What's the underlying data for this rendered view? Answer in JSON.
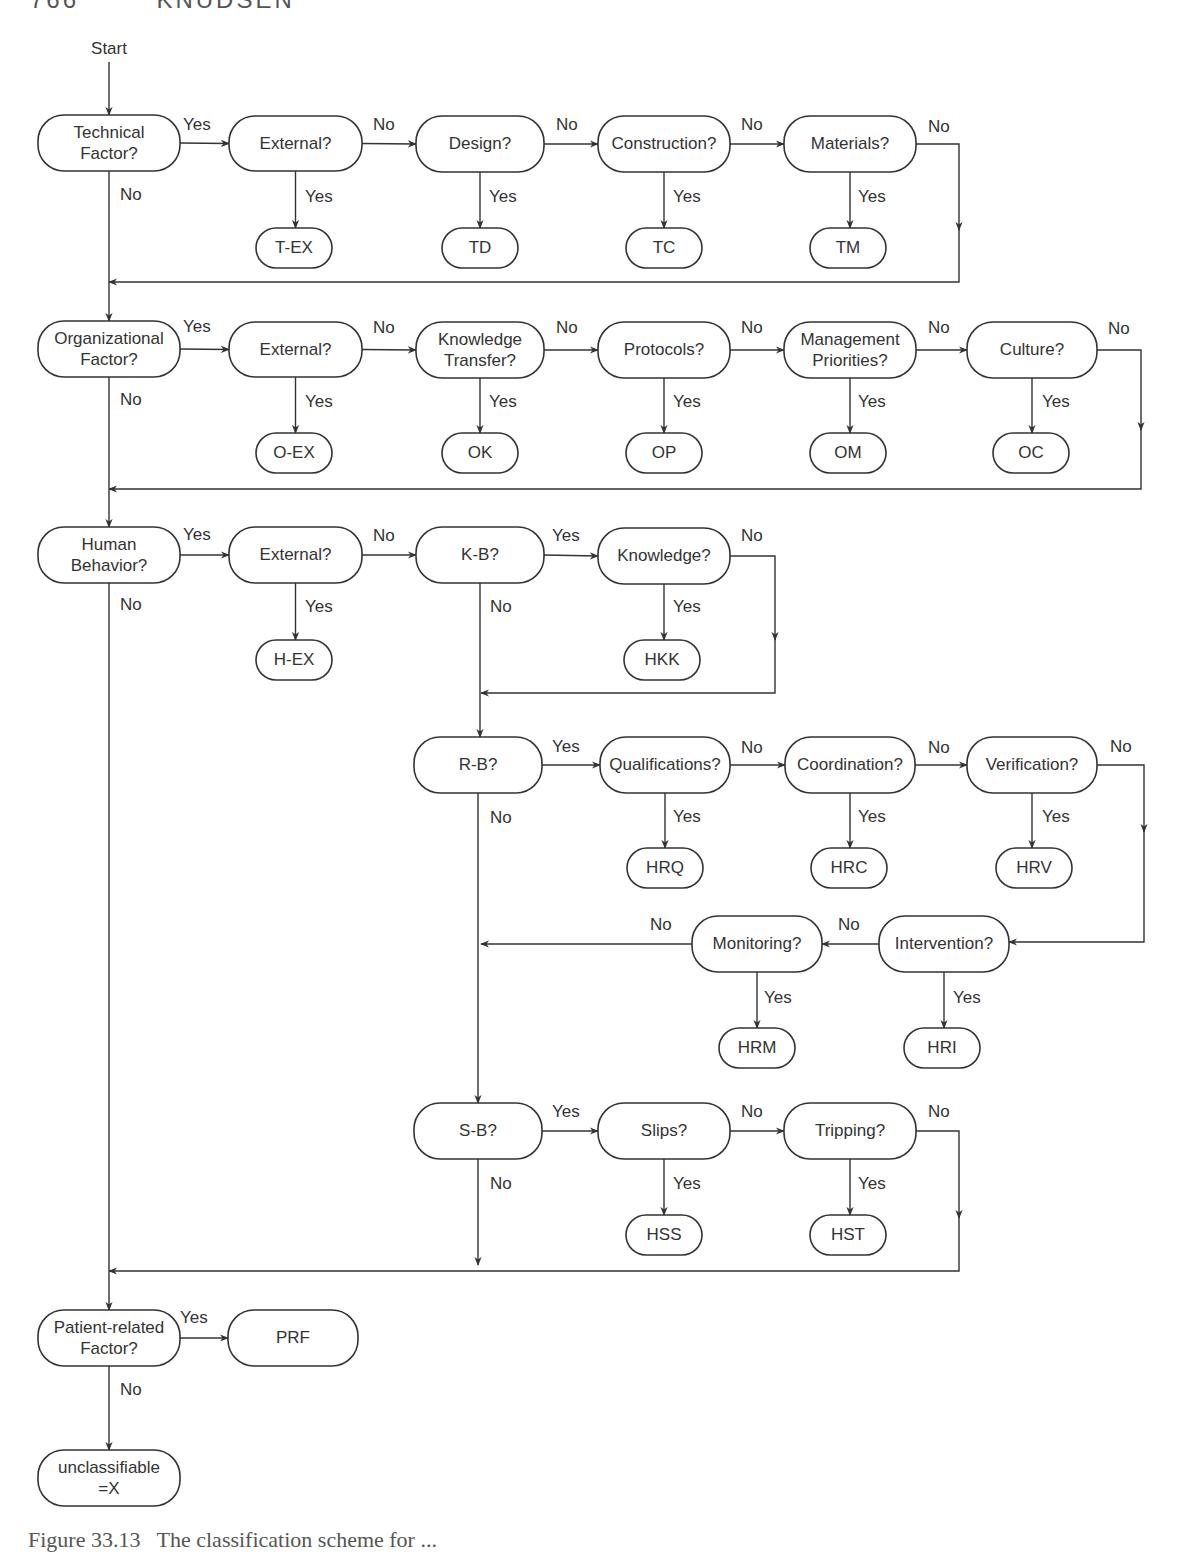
{
  "page": {
    "header_fragment": "766        KNUDSEN",
    "caption_fragment": "Figure 33.13   The classification scheme for ..."
  },
  "diagram": {
    "type": "flowchart",
    "start_label": "Start",
    "edge_labels": {
      "yes": "Yes",
      "no": "No"
    },
    "nodes": {
      "technical": [
        "Technical",
        "Factor?"
      ],
      "t_external": [
        "External?"
      ],
      "t_design": [
        "Design?"
      ],
      "t_construction": [
        "Construction?"
      ],
      "t_materials": [
        "Materials?"
      ],
      "t_ex": [
        "T-EX"
      ],
      "td": [
        "TD"
      ],
      "tc": [
        "TC"
      ],
      "tm": [
        "TM"
      ],
      "organizational": [
        "Organizational",
        "Factor?"
      ],
      "o_external": [
        "External?"
      ],
      "o_knowledge_transfer": [
        "Knowledge",
        "Transfer?"
      ],
      "o_protocols": [
        "Protocols?"
      ],
      "o_management": [
        "Management",
        "Priorities?"
      ],
      "o_culture": [
        "Culture?"
      ],
      "o_ex": [
        "O-EX"
      ],
      "ok": [
        "OK"
      ],
      "op": [
        "OP"
      ],
      "om": [
        "OM"
      ],
      "oc": [
        "OC"
      ],
      "human": [
        "Human",
        "Behavior?"
      ],
      "h_external": [
        "External?"
      ],
      "h_ex": [
        "H-EX"
      ],
      "kb": [
        "K-B?"
      ],
      "knowledge": [
        "Knowledge?"
      ],
      "hkk": [
        "HKK"
      ],
      "rb": [
        "R-B?"
      ],
      "qualifications": [
        "Qualifications?"
      ],
      "coordination": [
        "Coordination?"
      ],
      "verification": [
        "Verification?"
      ],
      "hrq": [
        "HRQ"
      ],
      "hrc": [
        "HRC"
      ],
      "hrv": [
        "HRV"
      ],
      "intervention": [
        "Intervention?"
      ],
      "monitoring": [
        "Monitoring?"
      ],
      "hri": [
        "HRI"
      ],
      "hrm": [
        "HRM"
      ],
      "sb": [
        "S-B?"
      ],
      "slips": [
        "Slips?"
      ],
      "tripping": [
        "Tripping?"
      ],
      "hss": [
        "HSS"
      ],
      "hst": [
        "HST"
      ],
      "patient": [
        "Patient-related",
        "Factor?"
      ],
      "prf": [
        "PRF"
      ],
      "unclassifiable": [
        "unclassifiable",
        "=X"
      ]
    },
    "colors": {
      "stroke": "#333333",
      "text": "#333333",
      "background": "#ffffff"
    }
  }
}
